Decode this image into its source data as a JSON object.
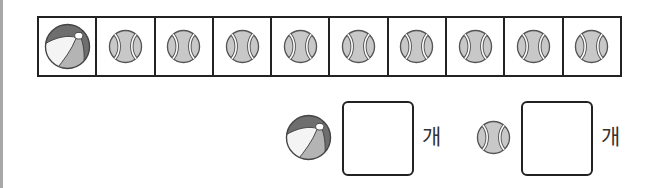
{
  "grid": {
    "cells": [
      {
        "item": "beach-ball"
      },
      {
        "item": "tennis-ball"
      },
      {
        "item": "tennis-ball"
      },
      {
        "item": "tennis-ball"
      },
      {
        "item": "tennis-ball"
      },
      {
        "item": "tennis-ball"
      },
      {
        "item": "tennis-ball"
      },
      {
        "item": "tennis-ball"
      },
      {
        "item": "tennis-ball"
      },
      {
        "item": "tennis-ball"
      }
    ]
  },
  "answers": [
    {
      "item": "beach-ball",
      "value": "",
      "unit": "개"
    },
    {
      "item": "tennis-ball",
      "value": "",
      "unit": "개"
    }
  ],
  "colors": {
    "outline": "#222222",
    "ball_gray": "#c8c8c8",
    "beach_dark": "#6e6e6e",
    "beach_mid": "#b4b4b4",
    "beach_light": "#f4f4f4"
  }
}
